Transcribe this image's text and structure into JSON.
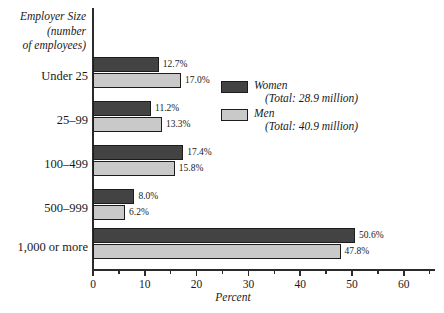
{
  "chart_data": {
    "type": "bar",
    "orientation": "horizontal",
    "title": "",
    "xlabel": "Percent",
    "ylabel": "Employer Size (number of employees)",
    "ylabel_lines": [
      "Employer Size",
      "(number",
      "of employees)"
    ],
    "categories": [
      "Under 25",
      "25–99",
      "100–499",
      "500–999",
      "1,000 or more"
    ],
    "series": [
      {
        "name": "Women",
        "total_label": "(Total: 28.9 million)",
        "color": "#434343",
        "values": [
          12.7,
          11.2,
          17.4,
          8.0,
          50.6
        ],
        "value_labels": [
          "12.7%",
          "11.2%",
          "17.4%",
          "8.0%",
          "50.6%"
        ]
      },
      {
        "name": "Men",
        "total_label": "(Total: 40.9 million)",
        "color": "#c9c9c9",
        "values": [
          17.0,
          13.3,
          15.8,
          6.2,
          47.8
        ],
        "value_labels": [
          "17.0%",
          "13.3%",
          "15.8%",
          "6.2%",
          "47.8%"
        ]
      }
    ],
    "xlim": [
      0,
      66
    ],
    "xticks": [
      0,
      10,
      20,
      30,
      40,
      50,
      60
    ],
    "xtick_labels": [
      "0",
      "10",
      "20",
      "30",
      "40",
      "50",
      "60"
    ],
    "xticks_minor": [
      5,
      15,
      25,
      35,
      45,
      55,
      65
    ],
    "grid": false,
    "legend_position": "upper-right-inside",
    "units": "percent"
  },
  "legend": {
    "entries": [
      {
        "label": "Women",
        "total": "(Total: 28.9 million)"
      },
      {
        "label": "Men",
        "total": "(Total: 40.9 million)"
      }
    ]
  },
  "axes": {
    "x_title": "Percent",
    "y_caption_line1": "Employer Size",
    "y_caption_line2": "(number",
    "y_caption_line3": "of employees)"
  }
}
